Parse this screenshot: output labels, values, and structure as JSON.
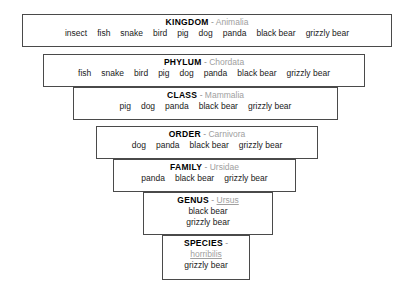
{
  "diagram": {
    "separator": "-",
    "colors": {
      "border": "#4a4a4a",
      "rank_text": "#000000",
      "latin_text": "#a0a0a0",
      "member_text": "#1a1a1a",
      "background": "#ffffff"
    },
    "ranks": [
      {
        "rank": "KINGDOM",
        "latin": "Animalia",
        "latin_underlined": false,
        "members": [
          "insect",
          "fish",
          "snake",
          "bird",
          "pig",
          "dog",
          "panda",
          "black bear",
          "grizzly bear"
        ],
        "stacked": false
      },
      {
        "rank": "PHYLUM",
        "latin": "Chordata",
        "latin_underlined": false,
        "members": [
          "fish",
          "snake",
          "bird",
          "pig",
          "dog",
          "panda",
          "black bear",
          "grizzly bear"
        ],
        "stacked": false
      },
      {
        "rank": "CLASS",
        "latin": "Mammalia",
        "latin_underlined": false,
        "members": [
          "pig",
          "dog",
          "panda",
          "black bear",
          "grizzly bear"
        ],
        "stacked": false
      },
      {
        "rank": "ORDER",
        "latin": "Carnivora",
        "latin_underlined": false,
        "members": [
          "dog",
          "panda",
          "black bear",
          "grizzly bear"
        ],
        "stacked": false
      },
      {
        "rank": "FAMILY",
        "latin": "Ursidae",
        "latin_underlined": false,
        "members": [
          "panda",
          "black bear",
          "grizzly bear"
        ],
        "stacked": false
      },
      {
        "rank": "GENUS",
        "latin": "Ursus",
        "latin_underlined": true,
        "members": [
          "black bear",
          "grizzly bear"
        ],
        "stacked": true
      },
      {
        "rank": "SPECIES",
        "latin": "horribilis",
        "latin_underlined": true,
        "members": [
          "grizzly bear"
        ],
        "stacked": true
      }
    ]
  }
}
